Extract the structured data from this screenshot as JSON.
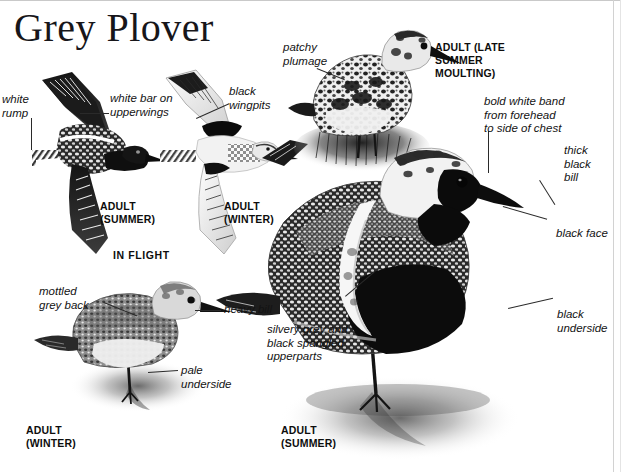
{
  "page": {
    "title": "Grey Plover",
    "species": "Grey Plover"
  },
  "plates": [
    {
      "id": "flight-summer",
      "caption": "ADULT\n(SUMMER)",
      "pose": "in-flight-upperwing",
      "plumage": "summer"
    },
    {
      "id": "flight-winter",
      "caption": "ADULT\n(WINTER)",
      "pose": "in-flight-underwing",
      "plumage": "winter"
    },
    {
      "id": "moulting",
      "caption": "ADULT (LATE\nSUMMER\nMOULTING)",
      "pose": "standing",
      "plumage": "late-summer-moulting"
    },
    {
      "id": "winter-standing",
      "caption": "ADULT\n(WINTER)",
      "pose": "standing",
      "plumage": "winter"
    },
    {
      "id": "summer-standing",
      "caption": "ADULT\n(SUMMER)",
      "pose": "standing",
      "plumage": "summer"
    }
  ],
  "section_labels": {
    "in_flight": "IN FLIGHT"
  },
  "annotations": {
    "white_rump": "white\nrump",
    "white_bar": "white bar on\nupperwings",
    "black_wingpits": "black\nwingpits",
    "patchy_plumage": "patchy\nplumage",
    "bold_white_band": "bold white band\nfrom forehead\nto side of chest",
    "thick_black_bill": "thick\nblack\nbill",
    "black_face": "black face",
    "black_underside": "black underside",
    "mottled_grey_back": "mottled\ngrey back",
    "heavy_bill": "heavy bill",
    "pale_underside": "pale\nunderside",
    "silvery_upperparts": "silvery grey and\nblack spangled\nupperparts"
  },
  "colors": {
    "ink": "#131313",
    "paper": "#ffffff",
    "caption": "#0d0d0d",
    "leader": "#2a2a2a",
    "plumage_dark": "#1d1d1d",
    "plumage_mid": "#7a7a7a",
    "plumage_light": "#d8d8d8"
  }
}
